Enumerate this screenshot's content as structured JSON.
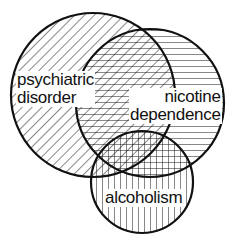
{
  "diagram": {
    "type": "venn",
    "sets": [
      {
        "id": "psychiatric",
        "label_line1": "psychiatric",
        "label_line2": "disorder",
        "hatch": "diagonal",
        "cx": 93,
        "cy": 95,
        "r": 82
      },
      {
        "id": "nicotine",
        "label_line1": "nicotine",
        "label_line2": "dependence",
        "hatch": "horizontal",
        "cx": 150,
        "cy": 103,
        "r": 74
      },
      {
        "id": "alcoholism",
        "label_line1": "alcoholism",
        "hatch": "vertical",
        "cx": 142,
        "cy": 182,
        "r": 51
      }
    ],
    "colors": {
      "stroke": "#111111",
      "background": "#ffffff"
    }
  }
}
